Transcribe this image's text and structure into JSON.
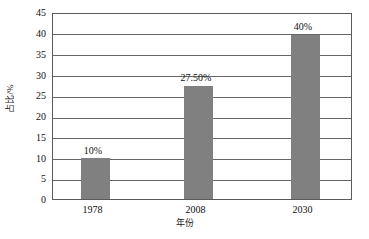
{
  "chart_data": {
    "type": "bar",
    "title": "",
    "categories": [
      "1978",
      "2008",
      "2030"
    ],
    "values": [
      10,
      27.5,
      40
    ],
    "data_labels": [
      "10%",
      "27.50%",
      "40%"
    ],
    "series": [
      {
        "name": "占比/%",
        "values": [
          10,
          27.5,
          40
        ]
      }
    ],
    "xlabel": "年份",
    "ylabel": "占比/%",
    "ylim": [
      0,
      45
    ],
    "ytick_step": 5,
    "ytick_labels": [
      "45",
      "40",
      "35",
      "30",
      "25",
      "20",
      "15",
      "10",
      "5",
      "0"
    ],
    "ytick_values": [
      45,
      40,
      35,
      30,
      25,
      20,
      15,
      10,
      5,
      0
    ],
    "grid": true,
    "grid_axis": "y",
    "legend": false,
    "bar_color": "#808080",
    "plot_border_color": "#5a5a5a",
    "background_color": "#ffffff"
  }
}
